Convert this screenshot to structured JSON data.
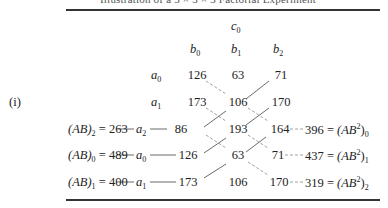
{
  "caption": "Illustration of a 3 × 3 × 3 Factorial Experiment",
  "panel_label": "(i)",
  "header": {
    "c_level": {
      "sym": "c",
      "sub": "0"
    },
    "b_levels": [
      {
        "sym": "b",
        "sub": "0"
      },
      {
        "sym": "b",
        "sub": "1"
      },
      {
        "sym": "b",
        "sub": "2"
      }
    ]
  },
  "rows": [
    {
      "a_sym": "a",
      "a_sub": "0",
      "values": [
        "126",
        "63",
        "71"
      ]
    },
    {
      "a_sym": "a",
      "a_sub": "1",
      "values": [
        "173",
        "106",
        "170"
      ]
    },
    {
      "a_sym": "a",
      "a_sub": "2",
      "values": [
        "86",
        "193",
        "164"
      ],
      "left": {
        "label": "(AB)",
        "sub": "2",
        "total": "263"
      },
      "right": {
        "total": "396",
        "label": "(AB",
        "sup": "2",
        "sub": "0"
      }
    },
    {
      "a_sym": "a",
      "a_sub": "0",
      "values": [
        "126",
        "63",
        "71"
      ],
      "left": {
        "label": "(AB)",
        "sub": "0",
        "total": "489"
      },
      "right": {
        "total": "437",
        "label": "(AB",
        "sup": "2",
        "sub": "1"
      }
    },
    {
      "a_sym": "a",
      "a_sub": "1",
      "values": [
        "173",
        "106",
        "170"
      ],
      "left": {
        "label": "(AB)",
        "sub": "1",
        "total": "400"
      },
      "right": {
        "total": "319",
        "label": "(AB",
        "sup": "2",
        "sub": "2"
      }
    }
  ],
  "equals": "=",
  "colors": {
    "text": "#222222",
    "rule": "#333333",
    "solid_line": "#444444",
    "dashed_line": "#888888"
  }
}
